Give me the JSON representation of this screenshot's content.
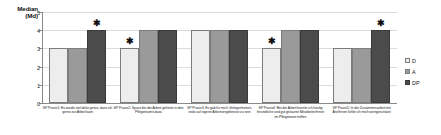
{
  "chart_data": {
    "type": "bar",
    "title": "",
    "subtitle": "",
    "ylabel": "Median (Md)",
    "ylabel_line1": "Median",
    "ylabel_line2": "(Md)",
    "xlabel": "",
    "ylim": [
      0,
      5
    ],
    "yticks": [
      "0",
      "1",
      "2",
      "3",
      "4",
      "5"
    ],
    "grid": true,
    "legend_position": "right",
    "categories": [
      "SP Praxis1: Es wurde viel dafür getan, dass ich gerne zur Arbeit kam",
      "SP Praxis2: Spass bei der Arbeit gehörte in den Pflegeteams dazu",
      "SP Praxis3: Es gab für mich Gelegenheiten, stolz auf eigene Arbeitsergebnisse zu sein",
      "SP Praxis4: Bei der Arbeit konnte ich häufig freundliche und gut gelaunte MitarbeiterInnen im Pflegeteam treffen",
      "SP Praxis5: In der Zusammenarbeit mit ÄrztInnen fühlte ich mich wertgeschätzt"
    ],
    "series": [
      {
        "name": "D",
        "color": "#ededed",
        "values": [
          3,
          3,
          4,
          3,
          3
        ]
      },
      {
        "name": "A",
        "color": "#9a9a9a",
        "values": [
          3,
          4,
          4,
          4,
          3
        ]
      },
      {
        "name": "DP",
        "color": "#4b4b4b",
        "values": [
          4,
          4,
          4,
          4,
          4
        ]
      }
    ],
    "annotations": [
      {
        "symbol": "✱",
        "group": 0,
        "series": 2,
        "label": "significance-marker"
      },
      {
        "symbol": "✱",
        "group": 1,
        "series": 0,
        "label": "significance-marker"
      },
      {
        "symbol": "✱",
        "group": 3,
        "series": 0,
        "label": "significance-marker"
      },
      {
        "symbol": "✱",
        "group": 4,
        "series": 2,
        "label": "significance-marker"
      }
    ]
  },
  "legend": {
    "items": [
      {
        "label": "D"
      },
      {
        "label": "A"
      },
      {
        "label": "DP"
      }
    ]
  }
}
